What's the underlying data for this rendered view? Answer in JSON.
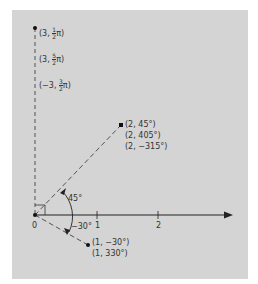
{
  "diagram": {
    "type": "polar-coordinates",
    "background": "#d4d4d4",
    "origin_label": "0",
    "axis_ticks": [
      "1",
      "2"
    ],
    "angle_labels": {
      "positive": "45°",
      "negative": "−30°"
    },
    "points": [
      {
        "name": "point-3-half-pi",
        "labels": [
          {
            "prefix": "(3, ",
            "num": "1",
            "den": "2",
            "suffix": "π)"
          },
          {
            "prefix": "(3, ",
            "num": "5",
            "den": "2",
            "suffix": "π)"
          },
          {
            "prefix": "(−3, ",
            "num": "3",
            "den": "2",
            "suffix": "π)"
          }
        ]
      },
      {
        "name": "point-2-45",
        "labels": [
          "(2, 45°)",
          "(2, 405°)",
          "(2, −315°)"
        ]
      },
      {
        "name": "point-1-neg30",
        "labels": [
          "(1, −30°)",
          "(1, 330°)"
        ]
      }
    ]
  }
}
